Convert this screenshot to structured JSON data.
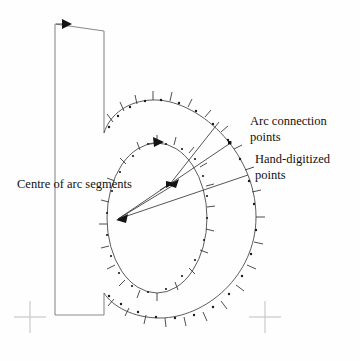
{
  "figure": {
    "background_color": "#fefefe",
    "ink_color": "#2a2a2a",
    "guide_color": "#c9c9c9"
  },
  "labels": {
    "arc_connection_line1": "Arc connection",
    "arc_connection_line2": "points",
    "hand_digitized_line1": "Hand-digitized",
    "hand_digitized_line2": "points",
    "centre_of_arc_segments": "Centre of arc segments"
  },
  "icons": {
    "direction_arrow_outer": "arrow-right-icon",
    "direction_arrow_inner": "arrow-right-icon",
    "centre_arrow_upper": "arrow-left-icon",
    "centre_arrow_lower": "arrow-left-icon",
    "registration_left": "crosshair-icon",
    "registration_right": "crosshair-icon",
    "arc_connection_marker": "square-point-icon"
  },
  "geometry": {
    "stem": {
      "top_left_x": 55,
      "top_y": 24,
      "right_x": 104,
      "bottom_y": 315,
      "bowl_join_top_y": 133,
      "bowl_join_bottom_y": 293
    },
    "outer_bowl": {
      "centre_x": 178,
      "centre_y": 217,
      "radius_x": 78,
      "radius_y": 117
    },
    "inner_bowl": {
      "centre_x": 157,
      "centre_y": 218,
      "radius_x": 50,
      "radius_y": 75
    },
    "arc_centres": [
      {
        "x": 170,
        "y": 184
      },
      {
        "x": 118,
        "y": 219
      }
    ],
    "registration_marks": [
      {
        "x": 30,
        "y": 317
      },
      {
        "x": 265,
        "y": 317
      }
    ],
    "arc_connection_point": {
      "x": 230,
      "y": 143
    }
  },
  "annotations": [
    {
      "name": "arc-connection-points",
      "text_x": 250,
      "text_y": 125,
      "leader_from": {
        "x": 228,
        "y": 145
      },
      "leader_to": {
        "x": 172,
        "y": 186
      }
    },
    {
      "name": "hand-digitized-points",
      "text_x": 253,
      "text_y": 162,
      "leader_from": {
        "x": 248,
        "y": 175
      },
      "leader_to": {
        "x": 120,
        "y": 220
      }
    },
    {
      "name": "centre-of-arc-segments",
      "text_x": 18,
      "text_y": 188,
      "leader_from": {
        "x": 160,
        "y": 190
      },
      "leader_to": {
        "x": 168,
        "y": 185
      }
    }
  ]
}
